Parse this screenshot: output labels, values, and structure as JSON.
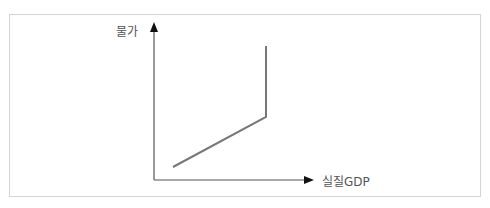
{
  "diagram": {
    "type": "economics-supply-curve",
    "y_axis_label": "물가",
    "x_axis_label": "실질GDP",
    "axis_color": "#555555",
    "curve_color": "#777777",
    "curve_points": [
      [
        173,
        167
      ],
      [
        266,
        117
      ],
      [
        266,
        46
      ]
    ]
  }
}
